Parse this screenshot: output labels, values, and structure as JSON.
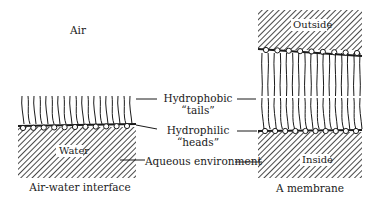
{
  "diagram": {
    "left_panel": {
      "region_above": "Air",
      "region_below": "Water",
      "caption": "Air-water interface"
    },
    "right_panel": {
      "region_above": "Outside",
      "region_below": "Inside",
      "caption": "A membrane"
    },
    "center_labels": {
      "tails_line1": "Hydrophobic",
      "tails_line2": "“tails”",
      "heads_line1": "Hydrophilic",
      "heads_line2": "“heads”",
      "aqueous": "Aqueous environment"
    },
    "colors": {
      "ink": "#1a1a1a",
      "background": "#ffffff"
    }
  }
}
